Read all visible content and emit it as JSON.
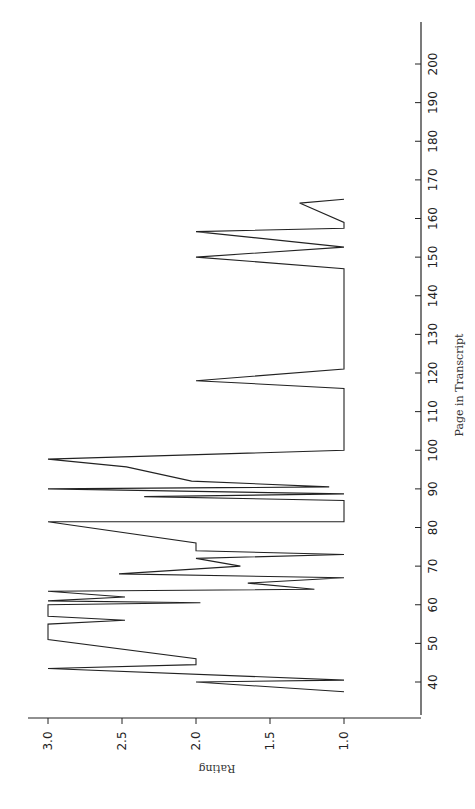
{
  "chart_data": {
    "type": "line",
    "orientation": "rotated-90-ccw",
    "title": "",
    "xlabel": "Page in Transcript",
    "ylabel": "Rating",
    "xlim": [
      33,
      210
    ],
    "ylim": [
      0.75,
      3.15
    ],
    "x_ticks": [
      40,
      50,
      60,
      70,
      80,
      90,
      100,
      110,
      120,
      130,
      140,
      150,
      160,
      170,
      180,
      190,
      200
    ],
    "y_ticks": [
      "3.0",
      "2.5",
      "2.0",
      "1.5",
      "1.0"
    ],
    "y_tick_values": [
      3.0,
      2.5,
      2.0,
      1.5,
      1.0
    ],
    "grid": false,
    "legend": null,
    "series": [
      {
        "name": "Rating",
        "points": [
          [
            37.5,
            1.0
          ],
          [
            40,
            2.0
          ],
          [
            40.5,
            1.0
          ],
          [
            43.5,
            3.0
          ],
          [
            44.5,
            2.0
          ],
          [
            46,
            2.0
          ],
          [
            51,
            3.0
          ],
          [
            55,
            3.0
          ],
          [
            56,
            2.48
          ],
          [
            57,
            3.0
          ],
          [
            60,
            3.0
          ],
          [
            60.5,
            1.97
          ],
          [
            61,
            3.0
          ],
          [
            62,
            2.48
          ],
          [
            63.5,
            3.0
          ],
          [
            64,
            1.2
          ],
          [
            65.6,
            1.65
          ],
          [
            67,
            1.0
          ],
          [
            68,
            2.52
          ],
          [
            70,
            1.7
          ],
          [
            72,
            2.0
          ],
          [
            73,
            1.0
          ],
          [
            74,
            2.0
          ],
          [
            76,
            2.0
          ],
          [
            81.5,
            3.0
          ],
          [
            81.5,
            1.0
          ],
          [
            87,
            1.0
          ],
          [
            88,
            2.35
          ],
          [
            88.7,
            1.0
          ],
          [
            90,
            3.0
          ],
          [
            90.5,
            1.1
          ],
          [
            92,
            2.03
          ],
          [
            95.7,
            2.47
          ],
          [
            97.7,
            3.0
          ],
          [
            100,
            1.0
          ],
          [
            116,
            1.0
          ],
          [
            118,
            2.0
          ],
          [
            121,
            1.0
          ],
          [
            147,
            1.0
          ],
          [
            150,
            2.0
          ],
          [
            152.6,
            1.0
          ],
          [
            156.6,
            2.0
          ],
          [
            157.5,
            1.0
          ],
          [
            159,
            1.0
          ],
          [
            164,
            1.3
          ],
          [
            165,
            1.0
          ]
        ]
      }
    ]
  }
}
